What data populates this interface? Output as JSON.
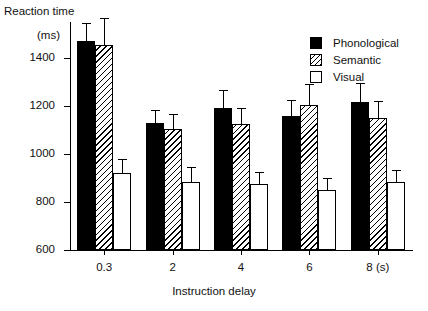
{
  "chart_data": {
    "type": "bar",
    "title": "",
    "ylabel": "Reaction time",
    "yunit": "(ms)",
    "xlabel": "Instruction delay",
    "categories": [
      "0.3",
      "2",
      "4",
      "6",
      "8 (s)"
    ],
    "ylim": [
      600,
      1550
    ],
    "yticks": [
      600,
      800,
      1000,
      1200,
      1400
    ],
    "ytick_labels": [
      "600",
      "800",
      "1000",
      "1200",
      "1400"
    ],
    "grid": false,
    "legend_position": "top-right",
    "series": [
      {
        "name": "Phonological",
        "fill": "solid-black",
        "color": "#000000",
        "values": [
          1470,
          1130,
          1190,
          1160,
          1215
        ],
        "errors": [
          75,
          55,
          75,
          65,
          80
        ]
      },
      {
        "name": "Semantic",
        "fill": "diagonal-hatch",
        "color": "#ffffff",
        "values": [
          1455,
          1105,
          1125,
          1205,
          1150
        ],
        "errors": [
          110,
          60,
          65,
          85,
          70
        ]
      },
      {
        "name": "Visual",
        "fill": "white",
        "color": "#ffffff",
        "values": [
          920,
          885,
          875,
          850,
          885
        ],
        "errors": [
          60,
          60,
          50,
          50,
          50
        ]
      }
    ]
  },
  "legend": {
    "items": [
      {
        "label": "Phonological",
        "swatch": "phonological"
      },
      {
        "label": "Semantic",
        "swatch": "semantic"
      },
      {
        "label": "Visual",
        "swatch": "visual"
      }
    ]
  }
}
